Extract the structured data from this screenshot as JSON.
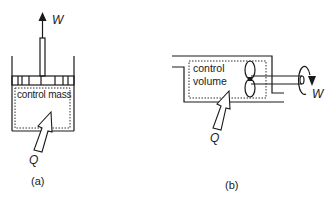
{
  "diagram_a": {
    "work_label": "W",
    "region_label": "control mass",
    "heat_label": "Q",
    "caption": "(a)"
  },
  "diagram_b": {
    "region_label_line1": "control",
    "region_label_line2": "volume",
    "heat_label": "Q",
    "work_label": "W",
    "caption": "(b)"
  },
  "colors": {
    "stroke": "#1a1a1a",
    "background": "#ffffff"
  }
}
